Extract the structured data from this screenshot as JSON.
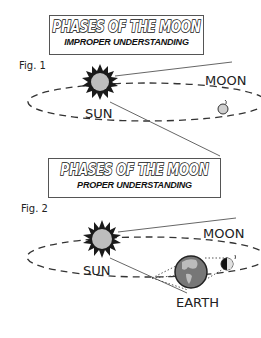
{
  "fig1": {
    "title": "PHASES OF THE MOON",
    "subtitle": "IMPROPER UNDERSTANDING",
    "label": "Fig. 1",
    "sun_label": "SUN",
    "moon_label": "MOON"
  },
  "fig2": {
    "title": "PHASES OF THE MOON",
    "subtitle": "PROPER UNDERSTANDING",
    "label": "Fig. 2",
    "sun_label": "SUN",
    "moon_label": "MOON",
    "earth_label": "EARTH"
  },
  "colors": {
    "sun_core": "#bdbdbd",
    "sun_rays": "#1a1a1a",
    "moon": "#cfcfcf",
    "earth_land": "#bcbcbc",
    "earth_ocean": "#777777"
  }
}
